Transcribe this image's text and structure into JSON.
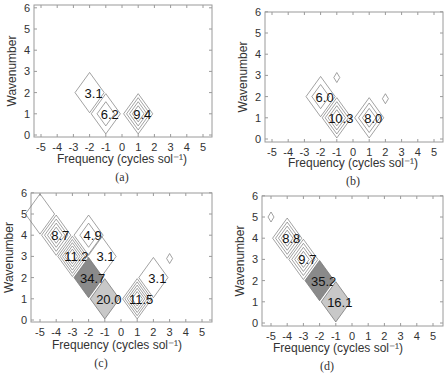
{
  "chart_data": [
    {
      "type": "heatmap",
      "panel": "(a)",
      "xlabel": "Frequency (cycles sol⁻¹)",
      "ylabel": "Wavenumber",
      "xticks": [
        "-5",
        "-4",
        "-3",
        "-2",
        "-1",
        "0",
        "1",
        "2",
        "3",
        "4",
        "5"
      ],
      "yticks": [
        "0",
        "1",
        "2",
        "3",
        "4",
        "5",
        "6"
      ],
      "xlim": [
        -5.5,
        5.5
      ],
      "ylim": [
        0,
        6
      ],
      "peaks": [
        {
          "x": -2,
          "y": 2,
          "label": "3.1",
          "rings": 1,
          "fill": "none"
        },
        {
          "x": -1,
          "y": 1,
          "label": "6.2",
          "rings": 2,
          "fill": "none"
        },
        {
          "x": 1,
          "y": 1,
          "label": "9.4",
          "rings": 4,
          "fill": "none"
        }
      ]
    },
    {
      "type": "heatmap",
      "panel": "(b)",
      "xlabel": "Frequency (cycles sol⁻¹)",
      "ylabel": "Wavenumber",
      "xticks": [
        "-5",
        "-4",
        "-3",
        "-2",
        "-1",
        "0",
        "1",
        "2",
        "3",
        "4",
        "5"
      ],
      "yticks": [
        "0",
        "1",
        "2",
        "3",
        "4",
        "5",
        "6"
      ],
      "xlim": [
        -5.5,
        5.5
      ],
      "ylim": [
        0,
        6
      ],
      "peaks": [
        {
          "x": -2,
          "y": 2,
          "label": "6.0",
          "rings": 2,
          "fill": "none"
        },
        {
          "x": -1,
          "y": 1,
          "label": "10.3",
          "rings": 4,
          "fill": "none"
        },
        {
          "x": 1,
          "y": 1,
          "label": "8.0",
          "rings": 3,
          "fill": "none"
        },
        {
          "x": -1,
          "y": 2.9,
          "label": "",
          "rings": 1,
          "fill": "none",
          "small": true
        },
        {
          "x": 2,
          "y": 1.9,
          "label": "",
          "rings": 1,
          "fill": "none",
          "small": true
        }
      ]
    },
    {
      "type": "heatmap",
      "panel": "(c)",
      "xlabel": "Frequency (cycles sol⁻¹)",
      "ylabel": "Wavenumber",
      "xticks": [
        "-5",
        "-4",
        "-3",
        "-2",
        "-1",
        "0",
        "1",
        "2",
        "3",
        "4",
        "5"
      ],
      "yticks": [
        "0",
        "1",
        "2",
        "3",
        "4",
        "5",
        "6"
      ],
      "xlim": [
        -5.5,
        5.5
      ],
      "ylim": [
        0,
        6
      ],
      "peaks": [
        {
          "x": -5,
          "y": 5,
          "label": "",
          "rings": 1,
          "fill": "none"
        },
        {
          "x": -4,
          "y": 4,
          "label": "8.7",
          "rings": 4,
          "fill": "none"
        },
        {
          "x": -2,
          "y": 4,
          "label": "4.9",
          "rings": 2,
          "fill": "none"
        },
        {
          "x": -3,
          "y": 3,
          "label": "11.2",
          "rings": 5,
          "fill": "none"
        },
        {
          "x": -1.2,
          "y": 3,
          "label": "3.1",
          "rings": 1,
          "fill": "none"
        },
        {
          "x": -2,
          "y": 2,
          "label": "34.7",
          "rings": 1,
          "fill": "dark"
        },
        {
          "x": -1,
          "y": 1,
          "label": "20.0",
          "rings": 1,
          "fill": "light"
        },
        {
          "x": 1,
          "y": 1,
          "label": "11.5",
          "rings": 5,
          "fill": "none"
        },
        {
          "x": 2,
          "y": 2,
          "label": "3.1",
          "rings": 1,
          "fill": "none"
        },
        {
          "x": 3,
          "y": 2.9,
          "label": "",
          "rings": 1,
          "fill": "none",
          "small": true
        }
      ]
    },
    {
      "type": "heatmap",
      "panel": "(d)",
      "xlabel": "Frequency (cycles sol⁻¹)",
      "ylabel": "Wavenumber",
      "xticks": [
        "-5",
        "-4",
        "-3",
        "-2",
        "-1",
        "0",
        "1",
        "2",
        "3",
        "4",
        "5"
      ],
      "yticks": [
        "0",
        "1",
        "2",
        "3",
        "4",
        "5",
        "6"
      ],
      "xlim": [
        -5.5,
        5.5
      ],
      "ylim": [
        0,
        6
      ],
      "peaks": [
        {
          "x": -5,
          "y": 5,
          "label": "",
          "rings": 1,
          "fill": "none",
          "small": true
        },
        {
          "x": -4,
          "y": 4,
          "label": "8.8",
          "rings": 4,
          "fill": "none"
        },
        {
          "x": -3,
          "y": 3,
          "label": "9.7",
          "rings": 4,
          "fill": "none"
        },
        {
          "x": -2,
          "y": 2,
          "label": "35.2",
          "rings": 1,
          "fill": "dark"
        },
        {
          "x": -1,
          "y": 1,
          "label": "16.1",
          "rings": 1,
          "fill": "light"
        }
      ]
    }
  ],
  "panels": [
    {
      "id": "a",
      "caption": "(a)",
      "frame": [
        34,
        5,
        212,
        137
      ],
      "x0px": 122,
      "xscale": 16.2,
      "y0px": 135,
      "yscale": 21.2,
      "caption_pos": [
        122,
        181
      ],
      "xtitle_pos": [
        122,
        163
      ]
    },
    {
      "id": "b",
      "caption": "(b)",
      "frame": [
        265,
        12,
        443,
        142
      ],
      "x0px": 353,
      "xscale": 16.2,
      "y0px": 139,
      "yscale": 21.2,
      "caption_pos": [
        353,
        185
      ],
      "xtitle_pos": [
        353,
        167
      ]
    },
    {
      "id": "c",
      "caption": "(c)",
      "frame": [
        31,
        193,
        212,
        322
      ],
      "x0px": 121,
      "xscale": 16.2,
      "y0px": 320,
      "yscale": 21.2,
      "caption_pos": [
        101,
        367
      ],
      "xtitle_pos": [
        117,
        349
      ]
    },
    {
      "id": "d",
      "caption": "(d)",
      "frame": [
        262,
        196,
        443,
        326
      ],
      "x0px": 352,
      "xscale": 16.2,
      "y0px": 323,
      "yscale": 21.2,
      "caption_pos": [
        327,
        370
      ],
      "xtitle_pos": [
        338,
        352
      ]
    }
  ],
  "colors": {
    "frame": "#9a9a9a",
    "contour": "#7a7a7a",
    "dark_fill": "#8a8a8a",
    "light_fill": "#c8c8c8",
    "text": "#222222"
  }
}
